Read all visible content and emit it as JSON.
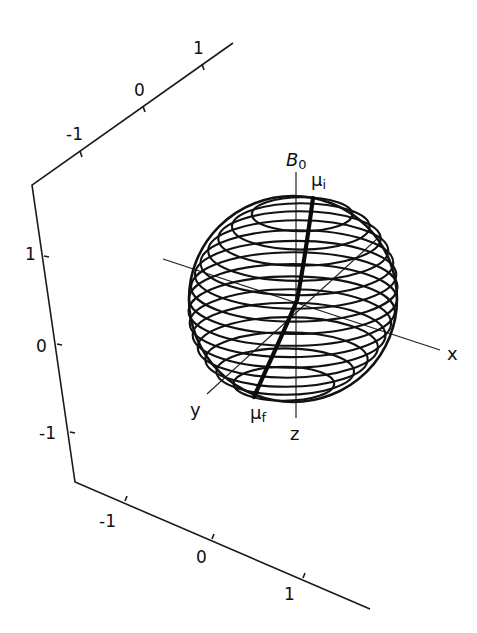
{
  "figure": {
    "frame_axes": {
      "top": {
        "ticks": [
          "-1",
          "0",
          "1"
        ]
      },
      "left": {
        "ticks": [
          "1",
          "0",
          "-1"
        ]
      },
      "bottom": {
        "ticks": [
          "-1",
          "0",
          "1"
        ]
      }
    },
    "sphere_axes": {
      "x_label": "x",
      "y_label": "y",
      "z_label": "z",
      "field_label": "B",
      "field_subscript": "0"
    },
    "vector": {
      "initial_label": "μ",
      "initial_subscript": "i",
      "final_label": "μ",
      "final_subscript": "f"
    },
    "sphere": {
      "center": [
        293,
        299
      ],
      "radius_x": 104,
      "radius_y": 103,
      "ring_count": 16
    },
    "colors": {
      "line": "#111111",
      "background": "#ffffff"
    }
  }
}
